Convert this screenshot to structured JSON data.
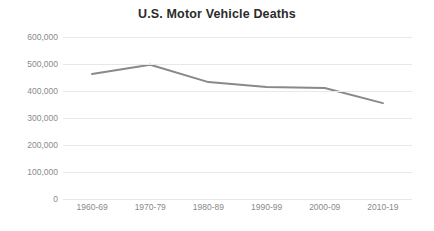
{
  "chart_data": {
    "type": "line",
    "title": "U.S. Motor Vehicle Deaths",
    "xlabel": "",
    "ylabel": "",
    "categories": [
      "1960-69",
      "1970-79",
      "1980-89",
      "1990-99",
      "2000-09",
      "2010-19"
    ],
    "values": [
      463000,
      497000,
      433000,
      415000,
      411000,
      355000
    ],
    "series": [
      {
        "name": "U.S. Motor Vehicle Deaths",
        "values": [
          463000,
          497000,
          433000,
          415000,
          411000,
          355000
        ]
      }
    ],
    "ylim": [
      0,
      600000
    ],
    "ytick_values": [
      0,
      100000,
      200000,
      300000,
      400000,
      500000,
      600000
    ],
    "ytick_labels": [
      "0",
      "100,000",
      "200,000",
      "300,000",
      "400,000",
      "500,000",
      "600,000"
    ],
    "grid": true,
    "grid_axis": "y",
    "legend": false,
    "legend_position": "none",
    "line_color": "#898989",
    "grid_color": "#e8e8e8",
    "background_color": "#ffffff",
    "title_color": "#2b2b2b",
    "tick_label_color": "#8a8a8a"
  }
}
